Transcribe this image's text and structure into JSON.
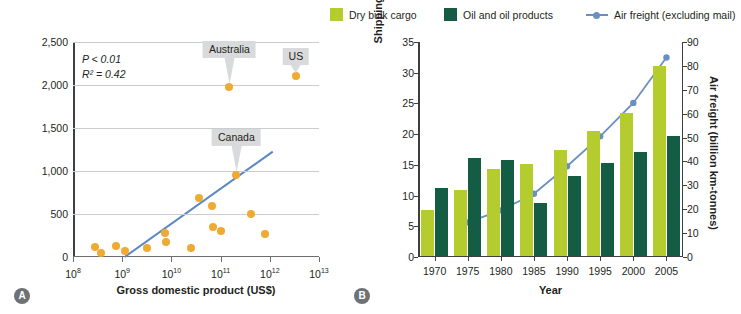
{
  "panels": {
    "a": {
      "tag": "A"
    },
    "b": {
      "tag": "B"
    }
  },
  "chart_data": [
    {
      "type": "scatter",
      "panel": "A",
      "title": "",
      "xlabel": "Gross domestic product (US$)",
      "ylabel": "Non-native plant species richness",
      "x_scale": "log",
      "xlim": [
        100000000,
        10000000000000
      ],
      "ylim": [
        0,
        2500
      ],
      "xtick_labels": [
        "10⁸",
        "10⁹",
        "10¹⁰",
        "10¹¹",
        "10¹²",
        "10¹³"
      ],
      "xtick_bases": [
        "10",
        "10",
        "10",
        "10",
        "10",
        "10"
      ],
      "xtick_exponents": [
        "8",
        "9",
        "10",
        "11",
        "12",
        "13"
      ],
      "ytick_labels": [
        "0",
        "500",
        "1,000",
        "1,500",
        "2,000",
        "2,500"
      ],
      "ytick_values": [
        0,
        500,
        1000,
        1500,
        2000,
        2500
      ],
      "grid": true,
      "annotations": [
        "P < 0.01",
        "R² = 0.42"
      ],
      "stat_p": "P < 0.01",
      "stat_r2": "R² = 0.42",
      "point_color": "#eeaa33",
      "trendline_color": "#5b87c5",
      "points": [
        {
          "log_x": 8.45,
          "y": 120,
          "label": ""
        },
        {
          "log_x": 8.57,
          "y": 45,
          "label": ""
        },
        {
          "log_x": 8.88,
          "y": 125,
          "label": ""
        },
        {
          "log_x": 9.05,
          "y": 70,
          "label": ""
        },
        {
          "log_x": 9.5,
          "y": 100,
          "label": ""
        },
        {
          "log_x": 9.88,
          "y": 285,
          "label": ""
        },
        {
          "log_x": 9.9,
          "y": 170,
          "label": ""
        },
        {
          "log_x": 10.4,
          "y": 100,
          "label": ""
        },
        {
          "log_x": 10.57,
          "y": 690,
          "label": ""
        },
        {
          "log_x": 10.82,
          "y": 590,
          "label": ""
        },
        {
          "log_x": 10.85,
          "y": 345,
          "label": ""
        },
        {
          "log_x": 11.0,
          "y": 300,
          "label": ""
        },
        {
          "log_x": 11.18,
          "y": 1980,
          "label": "Australia"
        },
        {
          "log_x": 11.32,
          "y": 955,
          "label": "Canada"
        },
        {
          "log_x": 11.62,
          "y": 500,
          "label": ""
        },
        {
          "log_x": 11.9,
          "y": 270,
          "label": ""
        },
        {
          "log_x": 12.53,
          "y": 2100,
          "label": "US"
        }
      ],
      "trendline": {
        "x0_log": 9.05,
        "y0": 0,
        "x1_log": 12.06,
        "y1": 1225
      },
      "callouts": [
        {
          "label": "Australia",
          "log_x": 11.18,
          "y": 1980,
          "size": "long"
        },
        {
          "label": "US",
          "log_x": 12.53,
          "y": 2100,
          "size": "short"
        },
        {
          "label": "Canada",
          "log_x": 11.32,
          "y": 955,
          "size": "long"
        }
      ]
    },
    {
      "type": "bar",
      "panel": "B",
      "title": "",
      "xlabel": "Year",
      "ylabel": "Shipping cargo (trillion km-tonnes)",
      "ylabel_right": "Air freight (billion km-tonnes)",
      "categories": [
        "1970",
        "1975",
        "1980",
        "1985",
        "1990",
        "1995",
        "2000",
        "2005"
      ],
      "ylim": [
        0,
        35
      ],
      "ytick_labels": [
        "0",
        "5",
        "10",
        "15",
        "20",
        "25",
        "30",
        "35"
      ],
      "ylim_right": [
        0,
        90
      ],
      "ytick_labels_right": [
        "0",
        "10",
        "20",
        "30",
        "40",
        "50",
        "60",
        "70",
        "80",
        "90"
      ],
      "grid": false,
      "legend_position": "top",
      "series": [
        {
          "name": "Dry bulk cargo",
          "type": "bar",
          "color": "#b4cc2e",
          "axis": "left",
          "values": [
            7.5,
            10.7,
            14.2,
            14.9,
            17.2,
            20.4,
            23.3,
            31.0
          ]
        },
        {
          "name": "Oil and oil products",
          "type": "bar",
          "color": "#145c44",
          "axis": "left",
          "values": [
            11.0,
            15.9,
            15.6,
            8.6,
            13.1,
            15.2,
            16.9,
            19.5
          ]
        },
        {
          "name": "Air freight (excluding mail)",
          "type": "line",
          "color": "#6b8fc4",
          "axis": "right",
          "x": [
            "1975",
            "1980",
            "1985",
            "1990",
            "1995",
            "2000",
            "2005"
          ],
          "values": [
            14.5,
            19.5,
            26.5,
            38.0,
            50.5,
            64.5,
            83.5
          ]
        }
      ]
    }
  ],
  "legend": {
    "items": [
      {
        "label": "Dry bulk cargo",
        "swatch": "square-swatch-dry",
        "color": "#b4cc2e"
      },
      {
        "label": "Oil and oil products",
        "swatch": "square-swatch-oil",
        "color": "#145c44"
      },
      {
        "label": "Air freight (excluding mail)",
        "swatch": "line-marker-swatch",
        "color": "#6b8fc4"
      }
    ]
  }
}
